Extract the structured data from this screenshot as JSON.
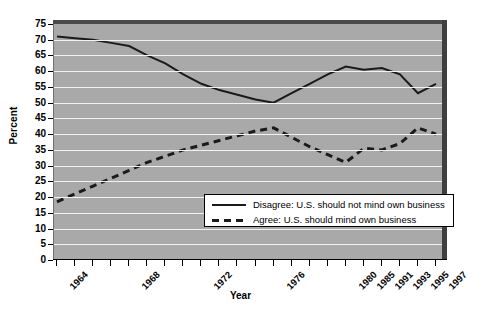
{
  "chart_data": {
    "type": "line",
    "title": "",
    "xlabel": "Year",
    "ylabel": "Percent",
    "ylim": [
      0,
      75
    ],
    "ytick_step": 5,
    "yticks": [
      0,
      5,
      10,
      15,
      20,
      25,
      30,
      35,
      40,
      45,
      50,
      55,
      60,
      65,
      70,
      75
    ],
    "grid": "horizontal",
    "legend_position": "inside-lower-right",
    "x": [
      1964,
      1965,
      1966,
      1967,
      1968,
      1969,
      1970,
      1971,
      1972,
      1973,
      1974,
      1975,
      1976,
      1977,
      1978,
      1979,
      1980,
      1985,
      1991,
      1993,
      1995,
      1997
    ],
    "xtick_labels": [
      "1964",
      "",
      "",
      "",
      "1968",
      "",
      "",
      "",
      "1972",
      "",
      "",
      "",
      "1976",
      "",
      "",
      "",
      "1980",
      "1985",
      "1991",
      "1993",
      "1995",
      "1997"
    ],
    "series": [
      {
        "name": "Disagree: U.S. should not mind own business",
        "style": "solid",
        "color": "#1a1a1a",
        "values": [
          71,
          70.5,
          70,
          69,
          68,
          65,
          62.5,
          59,
          56,
          54,
          52.5,
          51,
          50,
          53,
          56,
          59,
          61.5,
          60.5,
          61,
          59,
          53,
          56
        ]
      },
      {
        "name": "Agree: U.S. should mind own business",
        "style": "dashed",
        "color": "#1a1a1a",
        "values": [
          18.5,
          21,
          23.5,
          26,
          28.5,
          31,
          33,
          35,
          36.5,
          38,
          39.5,
          41,
          42,
          39,
          36,
          33.5,
          31,
          35.5,
          35,
          37,
          42,
          40
        ]
      }
    ]
  },
  "legend": {
    "entries": [
      {
        "label": "Disagree: U.S. should not mind own business",
        "style": "solid"
      },
      {
        "label": "Agree: U.S. should mind own business",
        "style": "dashed"
      }
    ]
  }
}
